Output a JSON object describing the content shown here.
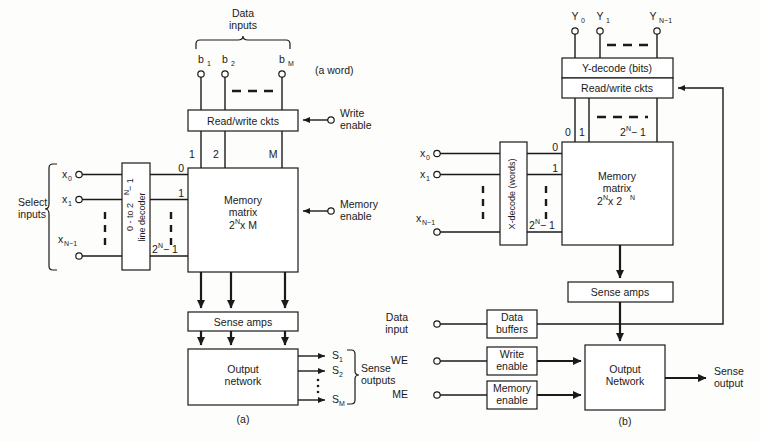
{
  "figure": {
    "caption_a": "(a)",
    "caption_b": "(b)"
  },
  "diagram_a": {
    "data_inputs_label_line1": "Data",
    "data_inputs_label_line2": "inputs",
    "a_word_note": "(a word)",
    "bit_terminals": [
      "b",
      "b",
      "b"
    ],
    "bit_subscripts": [
      "1",
      "2",
      "M"
    ],
    "readwrite_box": "Read/write ckts",
    "write_enable_line1": "Write",
    "write_enable_line2": "enable",
    "column_labels": [
      "1",
      "2",
      "M"
    ],
    "select_inputs_line1": "Select",
    "select_inputs_line2": "inputs",
    "x_terminals": [
      "x",
      "x",
      "x"
    ],
    "x_subscripts": [
      "0",
      "1",
      "N−1"
    ],
    "decoder_line1_a": "0 - to 2",
    "decoder_line1_sup": "N",
    "decoder_line1_b": " − 1",
    "decoder_line2": "line decoder",
    "row_labels": [
      "0",
      "1"
    ],
    "row_label_last_base": "2",
    "row_label_last_sup": "N",
    "row_label_last_tail": " − 1",
    "memory_matrix_line1": "Memory",
    "memory_matrix_line2": "matrix",
    "memory_matrix_line3_base": "2",
    "memory_matrix_line3_sup": "N",
    "memory_matrix_line3_tail": " x M",
    "memory_enable_line1": "Memory",
    "memory_enable_line2": "enable",
    "sense_amps_box": "Sense amps",
    "output_network_line1": "Output",
    "output_network_line2": "network",
    "s_outputs": [
      "S",
      "S",
      "S"
    ],
    "s_subscripts": [
      "1",
      "2",
      "M"
    ],
    "sense_outputs_line1": "Sense",
    "sense_outputs_line2": "outputs"
  },
  "diagram_b": {
    "y_terminals": [
      "Y",
      "Y",
      "Y"
    ],
    "y_subscripts": [
      "0",
      "1",
      "N−1"
    ],
    "y_decode_box": "Y-decode (bits)",
    "readwrite_box": "Read/write ckts",
    "col_labels": [
      "0",
      "1"
    ],
    "col_label_last_base": "2",
    "col_label_last_sup": "N",
    "col_label_last_tail": " − 1",
    "x_terminals": [
      "x",
      "x",
      "x"
    ],
    "x_subscripts": [
      "0",
      "1",
      "N−1"
    ],
    "x_decode_line1": "X-decode (words)",
    "row_labels": [
      "0",
      "1"
    ],
    "row_label_last_base": "2",
    "row_label_last_sup": "N",
    "row_label_last_tail": " − 1",
    "memory_matrix_line1": "Memory",
    "memory_matrix_line2": "matrix",
    "memory_matrix_line3_base": "2",
    "memory_matrix_line3_sup": "N",
    "memory_matrix_line3_mid": " x 2",
    "memory_matrix_line3_sup2": "N",
    "sense_amps_box": "Sense amps",
    "data_input_line1": "Data",
    "data_input_line2": "input",
    "data_buffers_line1": "Data",
    "data_buffers_line2": "buffers",
    "we_label": "WE",
    "write_enable_line1": "Write",
    "write_enable_line2": "enable",
    "me_label": "ME",
    "memory_enable_line1": "Memory",
    "memory_enable_line2": "enable",
    "output_network_line1": "Output",
    "output_network_line2": "Network",
    "sense_output_line1": "Sense",
    "sense_output_line2": "output"
  },
  "colors": {
    "ink": "#1a1a1a",
    "paper": "#fdfdfb",
    "box_fill": "#ffffff"
  }
}
